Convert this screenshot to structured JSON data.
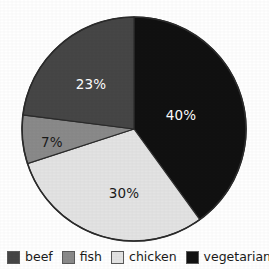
{
  "chart_data": {
    "type": "pie",
    "title": "",
    "subtitle": "",
    "xlabel": "",
    "ylabel": "",
    "grid": false,
    "legend_position": "bottom",
    "start_angle_deg": 0,
    "direction": "clockwise",
    "categories": [
      "vegetarian",
      "chicken",
      "fish",
      "beef"
    ],
    "values": [
      40,
      30,
      7,
      23
    ],
    "units": "%",
    "slices": [
      {
        "label": "vegetarian",
        "value": 40,
        "data_label": "40%",
        "color": "#111111",
        "label_color": "#ffffff",
        "label_x": 181,
        "label_y": 116
      },
      {
        "label": "chicken",
        "value": 30,
        "data_label": "30%",
        "color": "#e3e3e3",
        "label_color": "#1a1a1a",
        "label_x": 124,
        "label_y": 194
      },
      {
        "label": "fish",
        "value": 7,
        "data_label": "7%",
        "color": "#8a8a8a",
        "label_color": "#1a1a1a",
        "label_x": 52,
        "label_y": 143
      },
      {
        "label": "beef",
        "value": 23,
        "data_label": "23%",
        "color": "#464646",
        "label_color": "#ffffff",
        "label_x": 91,
        "label_y": 85
      }
    ],
    "legend": [
      {
        "label": "beef",
        "color": "#464646"
      },
      {
        "label": "fish",
        "color": "#8a8a8a"
      },
      {
        "label": "chicken",
        "color": "#e3e3e3"
      },
      {
        "label": "vegetarian",
        "color": "#111111"
      }
    ],
    "outline_color": "#2b2b2b",
    "background_color": "#ffffff"
  }
}
